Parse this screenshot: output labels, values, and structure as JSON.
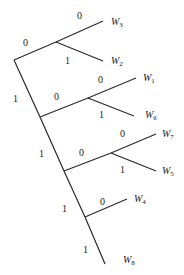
{
  "diagram": {
    "type": "binary-code-tree",
    "edges": [
      {
        "from": "root",
        "to": "n1",
        "bit": "0"
      },
      {
        "from": "n1",
        "to": "W3",
        "bit": "0"
      },
      {
        "from": "n1",
        "to": "W2",
        "bit": "1"
      },
      {
        "from": "root",
        "to": "n2",
        "bit": "1"
      },
      {
        "from": "n2",
        "to": "n3",
        "bit": "0"
      },
      {
        "from": "n3",
        "to": "W1",
        "bit": "0"
      },
      {
        "from": "n3",
        "to": "W6",
        "bit": "1"
      },
      {
        "from": "n2",
        "to": "n4",
        "bit": "1"
      },
      {
        "from": "n4",
        "to": "n5",
        "bit": "0"
      },
      {
        "from": "n5",
        "to": "W7",
        "bit": "0"
      },
      {
        "from": "n5",
        "to": "W5",
        "bit": "1"
      },
      {
        "from": "n4",
        "to": "n6",
        "bit": "1"
      },
      {
        "from": "n6",
        "to": "W4",
        "bit": "0"
      },
      {
        "from": "n6",
        "to": "W8",
        "bit": "1"
      }
    ],
    "leaves": {
      "W3": {
        "base": "W",
        "sub": "3"
      },
      "W2": {
        "base": "W",
        "sub": "2"
      },
      "W1": {
        "base": "W",
        "sub": "1"
      },
      "W6": {
        "base": "W",
        "sub": "6"
      },
      "W7": {
        "base": "W",
        "sub": "7"
      },
      "W5": {
        "base": "W",
        "sub": "5"
      },
      "W4": {
        "base": "W",
        "sub": "4"
      },
      "W8": {
        "base": "W",
        "sub": "8"
      }
    },
    "bits": {
      "root_n1": "0",
      "n1_W3": "0",
      "n1_W2": "1",
      "root_n2": "1",
      "n2_n3": "0",
      "n3_W1": "0",
      "n3_W6": "1",
      "n2_n4": "1",
      "n4_n5": "0",
      "n5_W7": "0",
      "n5_W5": "1",
      "n4_n6": "1",
      "n6_W4": "0",
      "n6_W8": "1"
    }
  }
}
